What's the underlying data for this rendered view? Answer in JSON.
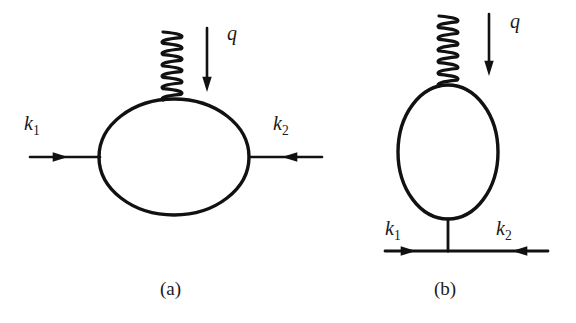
{
  "figure": {
    "kind": "feynman-diagram-pair",
    "background_color": "#ffffff",
    "ink_color": "#111111",
    "width": 576,
    "height": 323
  },
  "diagram_a": {
    "caption": "(a)",
    "caption_pos": {
      "x": 160,
      "y": 295
    },
    "loop": {
      "shape": "ellipse",
      "cx": 174,
      "cy": 157,
      "rx": 75,
      "ry": 58,
      "stroke_width": 3.4
    },
    "photon": {
      "type": "coil",
      "label": "q",
      "label_pos": {
        "x": 227,
        "y": 40
      },
      "x": 172,
      "y_top": 32,
      "y_bottom": 100,
      "turns": 6,
      "amplitude": 9,
      "stroke_width": 3.2
    },
    "momentum_arrow_q": {
      "x": 207,
      "y_start": 28,
      "y_end": 82,
      "direction": "down",
      "stroke_width": 2.6
    },
    "fermion_in": {
      "label": "k",
      "subscript": "1",
      "label_pos": {
        "x": 24,
        "y": 130
      },
      "x_start": 30,
      "x_end": 100,
      "y": 157,
      "direction": "right",
      "arrow_at": 68,
      "stroke_width": 2.6
    },
    "fermion_out": {
      "label": "k",
      "subscript": "2",
      "label_pos": {
        "x": 273,
        "y": 130
      },
      "x_start": 322,
      "x_end": 249,
      "y": 157,
      "direction": "left",
      "arrow_at": 282,
      "stroke_width": 2.6
    }
  },
  "diagram_b": {
    "caption": "(b)",
    "caption_pos": {
      "x": 434,
      "y": 295
    },
    "loop": {
      "shape": "ellipse",
      "cx": 448,
      "cy": 152,
      "rx": 50,
      "ry": 67,
      "stroke_width": 3.4
    },
    "photon": {
      "type": "coil",
      "label": "q",
      "label_pos": {
        "x": 510,
        "y": 28
      },
      "x": 448,
      "y_top": 16,
      "y_bottom": 86,
      "turns": 6,
      "amplitude": 9,
      "stroke_width": 3.2
    },
    "momentum_arrow_q": {
      "x": 489,
      "y_start": 14,
      "y_end": 66,
      "direction": "down",
      "stroke_width": 2.6
    },
    "stub": {
      "x": 448,
      "y_start": 219,
      "y_end": 251,
      "stroke_width": 2.8
    },
    "fermion_in": {
      "label": "k",
      "subscript": "1",
      "label_pos": {
        "x": 385,
        "y": 235
      },
      "x_start": 385,
      "x_end": 448,
      "y": 251,
      "direction": "right",
      "arrow_at": 416,
      "stroke_width": 2.8
    },
    "fermion_out": {
      "label": "k",
      "subscript": "2",
      "label_pos": {
        "x": 496,
        "y": 235
      },
      "x_start": 548,
      "x_end": 448,
      "y": 251,
      "direction": "left",
      "arrow_at": 512,
      "stroke_width": 2.8
    }
  }
}
